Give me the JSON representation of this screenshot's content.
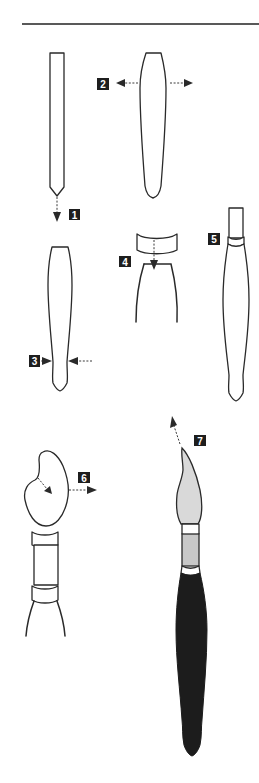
{
  "figure": {
    "title": "",
    "colors": {
      "line": "#2a2a2a",
      "badge": "#1e1e1e",
      "badge_text": "#ffffff",
      "bristle_fill": "#d9d9d9",
      "ferrule_fill": "#c8c8c8",
      "handle_fill": "#1c1c1c"
    },
    "steps": [
      {
        "id": 1,
        "label": "1",
        "description": "straight square stick, pointed end, arrow down"
      },
      {
        "id": 2,
        "label": "2",
        "description": "stick tapered wider, arrows outward"
      },
      {
        "id": 3,
        "label": "3",
        "description": "stick narrowed near bottom, arrows inward"
      },
      {
        "id": 4,
        "label": "4",
        "description": "ferrule band pressed down onto handle top"
      },
      {
        "id": 5,
        "label": "5",
        "description": "handle with ferrule fitted"
      },
      {
        "id": 6,
        "label": "6",
        "description": "bristle head shaped, arrow outward"
      },
      {
        "id": 7,
        "label": "7",
        "description": "finished painted brush, arrow toward tip"
      }
    ]
  }
}
